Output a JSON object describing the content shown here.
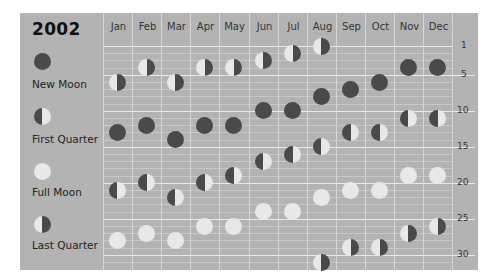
{
  "chart_data": {
    "type": "scatter",
    "title": "2002",
    "subtitle": "Moon phases by month",
    "xlabel": "",
    "ylabel": "Day of month",
    "categories": [
      "Jan",
      "Feb",
      "Mar",
      "Apr",
      "May",
      "Jun",
      "Jul",
      "Aug",
      "Sep",
      "Oct",
      "Nov",
      "Dec"
    ],
    "y_ticks": [
      1,
      5,
      10,
      15,
      20,
      25,
      30
    ],
    "ylim": [
      1,
      31
    ],
    "legend": [
      {
        "key": "new",
        "label": "New Moon"
      },
      {
        "key": "fq",
        "label": "First Quarter"
      },
      {
        "key": "full",
        "label": "Full Moon"
      },
      {
        "key": "lq",
        "label": "Last Quarter"
      }
    ],
    "series": [
      {
        "name": "New Moon",
        "key": "new",
        "values": [
          [
            13
          ],
          [
            12
          ],
          [
            14
          ],
          [
            12
          ],
          [
            12
          ],
          [
            10
          ],
          [
            10
          ],
          [
            8
          ],
          [
            7
          ],
          [
            6
          ],
          [
            4
          ],
          [
            4
          ]
        ]
      },
      {
        "name": "First Quarter",
        "key": "fq",
        "values": [
          [
            21
          ],
          [
            20
          ],
          [
            22
          ],
          [
            20
          ],
          [
            19
          ],
          [
            17
          ],
          [
            16
          ],
          [
            15
          ],
          [
            13
          ],
          [
            13
          ],
          [
            11
          ],
          [
            11
          ]
        ]
      },
      {
        "name": "Full Moon",
        "key": "full",
        "values": [
          [
            28
          ],
          [
            27
          ],
          [
            28
          ],
          [
            26
          ],
          [
            26
          ],
          [
            24
          ],
          [
            24
          ],
          [
            22
          ],
          [
            21
          ],
          [
            21
          ],
          [
            19
          ],
          [
            19
          ]
        ]
      },
      {
        "name": "Last Quarter",
        "key": "lq",
        "values": [
          [
            6
          ],
          [
            4
          ],
          [
            6
          ],
          [
            4
          ],
          [
            4
          ],
          [
            3
          ],
          [
            2
          ],
          [
            1,
            31
          ],
          [
            29
          ],
          [
            29
          ],
          [
            27
          ],
          [
            26
          ]
        ]
      }
    ],
    "grid": true,
    "legend_position": "left"
  },
  "header": {
    "year": "2002"
  },
  "legend": {
    "items": [
      {
        "key": "new",
        "label": "New Moon",
        "icon": "new-moon-icon"
      },
      {
        "key": "fq",
        "label": "First Quarter",
        "icon": "first-quarter-icon"
      },
      {
        "key": "full",
        "label": "Full Moon",
        "icon": "full-moon-icon"
      },
      {
        "key": "lq",
        "label": "Last Quarter",
        "icon": "last-quarter-icon"
      }
    ]
  },
  "months": [
    "Jan",
    "Feb",
    "Mar",
    "Apr",
    "May",
    "Jun",
    "Jul",
    "Aug",
    "Sep",
    "Oct",
    "Nov",
    "Dec"
  ],
  "axis_ticks": [
    "1",
    "5",
    "10",
    "15",
    "20",
    "25",
    "30"
  ],
  "colors": {
    "panel": "#b3b3b3",
    "dark": "#4a4a4a",
    "light": "#e8e8e8",
    "grid": "#c8c8c8",
    "grid_major": "#e9e9e9"
  }
}
